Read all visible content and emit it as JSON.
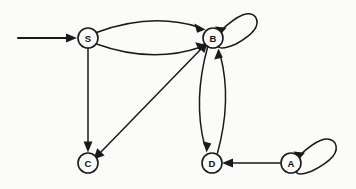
{
  "diagram": {
    "type": "directed-graph",
    "background_color": "#fbfbf9",
    "stroke_color": "#1a1a1a",
    "node_fill": "#fbfbf9",
    "node_radius": 10,
    "nodes": [
      {
        "id": "S",
        "label": "S",
        "cx": 88,
        "cy": 38,
        "is_start": true
      },
      {
        "id": "B",
        "label": "B",
        "cx": 213,
        "cy": 38,
        "is_start": false
      },
      {
        "id": "C",
        "label": "C",
        "cx": 88,
        "cy": 163,
        "is_start": false
      },
      {
        "id": "D",
        "label": "D",
        "cx": 212,
        "cy": 163,
        "is_start": false
      },
      {
        "id": "A",
        "label": "A",
        "cx": 291,
        "cy": 163,
        "is_start": false
      }
    ],
    "edges": [
      {
        "from": "start",
        "to": "S",
        "kind": "start-arrow",
        "label": ""
      },
      {
        "from": "S",
        "to": "B",
        "kind": "curve-upper",
        "label": ""
      },
      {
        "from": "S",
        "to": "B",
        "kind": "curve-lower",
        "label": ""
      },
      {
        "from": "S",
        "to": "C",
        "kind": "straight-vertical",
        "label": ""
      },
      {
        "from": "B",
        "to": "B",
        "kind": "self-loop",
        "label": ""
      },
      {
        "from": "B",
        "to": "C",
        "kind": "diagonal-bidirectional",
        "label": ""
      },
      {
        "from": "B",
        "to": "D",
        "kind": "curve-left",
        "label": ""
      },
      {
        "from": "D",
        "to": "B",
        "kind": "curve-right",
        "label": ""
      },
      {
        "from": "A",
        "to": "D",
        "kind": "straight-horizontal",
        "label": ""
      },
      {
        "from": "A",
        "to": "A",
        "kind": "self-loop",
        "label": ""
      }
    ]
  }
}
